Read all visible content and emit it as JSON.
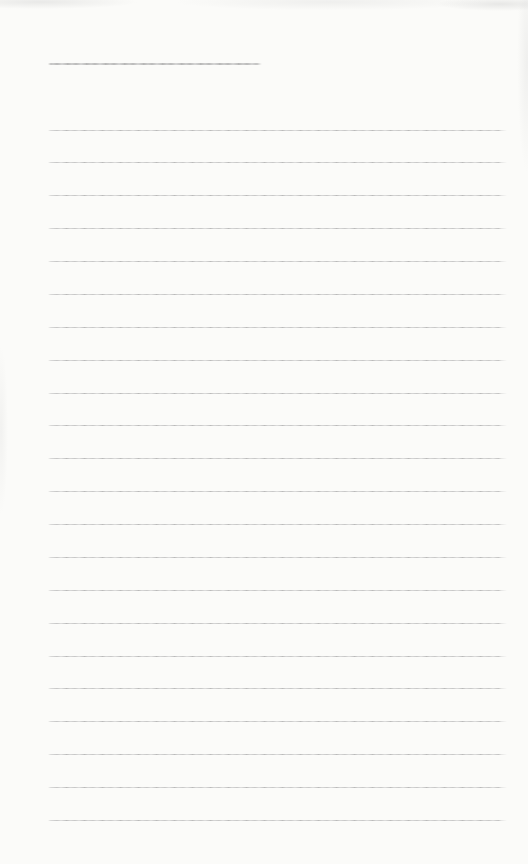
{
  "page": {
    "type": "blank-ruled-notebook-page",
    "background_color": "#fbfbf9",
    "rule_color": "#c2c2c2",
    "rule_dark_color": "#b0b0b0",
    "title_underline": {
      "x": 48,
      "y": 63,
      "width": 214,
      "thickness": 2
    },
    "ruling": {
      "count": 22,
      "first_y": 129.5,
      "spacing": 32.88,
      "x_start": 48,
      "x_end": 507,
      "thickness": 1
    },
    "text_content": ""
  }
}
